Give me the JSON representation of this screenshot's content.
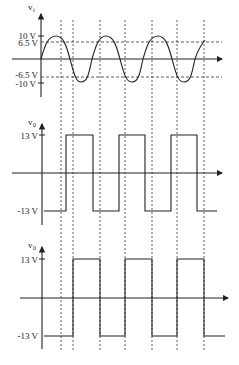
{
  "figure": {
    "panels": [
      {
        "name": "input-waveform",
        "axis_label": "v",
        "axis_subscript": "i",
        "ticks": [
          {
            "label": "10 V",
            "value": 10
          },
          {
            "label": "6.5 V",
            "value": 6.5
          },
          {
            "label": "-6.5 V",
            "value": -6.5
          },
          {
            "label": "-10 V",
            "value": -10
          }
        ],
        "waveform": "sine",
        "amplitude": 10,
        "thresholds": [
          6.5,
          -6.5
        ]
      },
      {
        "name": "output-waveform-1",
        "axis_label": "v",
        "axis_subscript": "0",
        "ticks": [
          {
            "label": "13 V",
            "value": 13
          },
          {
            "label": "-13 V",
            "value": -13
          }
        ],
        "waveform": "square",
        "levels": [
          13,
          -13
        ]
      },
      {
        "name": "output-waveform-2",
        "axis_label": "v",
        "axis_subscript": "0",
        "ticks": [
          {
            "label": "13 V",
            "value": 13
          },
          {
            "label": "-13 V",
            "value": -13
          }
        ],
        "waveform": "square",
        "levels": [
          13,
          -13
        ]
      }
    ],
    "colors": {
      "line": "#222222",
      "dashed": "#333333"
    }
  }
}
